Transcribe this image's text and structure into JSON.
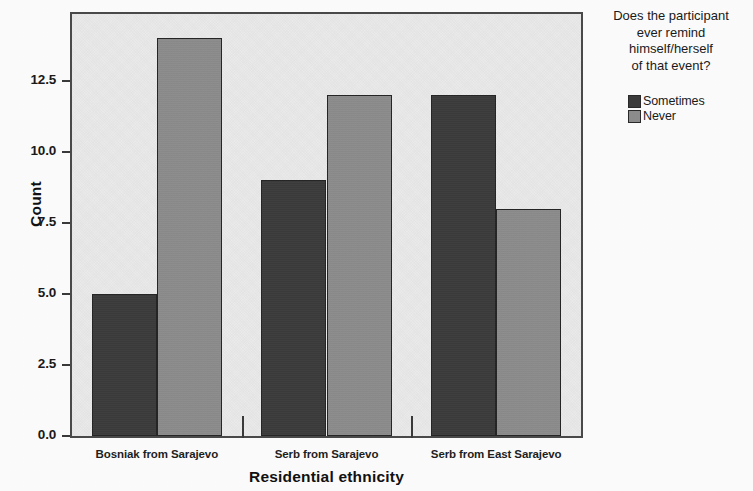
{
  "chart_data": {
    "type": "bar",
    "title": "",
    "subtitle": "",
    "xlabel": "Residential ethnicity",
    "ylabel": "Count",
    "categories": [
      "Bosniak from Sarajevo",
      "Serb from Sarajevo",
      "Serb from East Sarajevo"
    ],
    "series": [
      {
        "name": "Sometimes",
        "values": [
          5,
          9,
          12
        ],
        "color": "#3c3c3c"
      },
      {
        "name": "Never",
        "values": [
          14,
          12,
          8
        ],
        "color": "#8d8d8d"
      }
    ],
    "ylim": [
      0,
      14.85
    ],
    "y_ticks": [
      "0.0",
      "2.5",
      "5.0",
      "7.5",
      "10.0",
      "12.5"
    ],
    "y_tick_values": [
      0,
      2.5,
      5,
      7.5,
      10,
      12.5
    ],
    "grid": false,
    "legend_position": "right",
    "legend_title": "Does the participant\never remind\nhimself/herself\nof that event?",
    "plot_background": "#ececec",
    "frame_color": "#4a4a4a"
  },
  "axes": {
    "y_title": "Count",
    "x_title": "Residential ethnicity"
  },
  "legend": {
    "title": "Does the participant\never remind\nhimself/herself\nof that event?",
    "items": [
      {
        "label": "Sometimes",
        "color": "#3c3c3c"
      },
      {
        "label": "Never",
        "color": "#8d8d8d"
      }
    ]
  }
}
